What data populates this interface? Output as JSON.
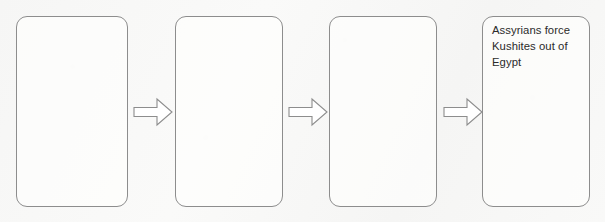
{
  "diagram": {
    "type": "linear-flowchart",
    "orientation": "horizontal",
    "step_count": 4,
    "arrow_count": 3,
    "colors": {
      "background": "#f8f8f7",
      "box_border": "#8d8d8d",
      "box_fill": "#fdfdfc",
      "arrow_stroke": "#8d8d8d",
      "arrow_fill": "#ffffff",
      "text": "#2b2b2b"
    },
    "boxes": [
      {
        "id": "step-1",
        "text": "",
        "x": 16,
        "width": 112
      },
      {
        "id": "step-2",
        "text": "",
        "x": 175,
        "width": 108
      },
      {
        "id": "step-3",
        "text": "",
        "x": 329,
        "width": 108
      },
      {
        "id": "step-4",
        "text": "Assyrians force Kushites out of Egypt",
        "x": 482,
        "width": 108
      }
    ],
    "arrows": [
      {
        "id": "arrow-1",
        "icon": "right-arrow-icon",
        "x": 133,
        "width": 40
      },
      {
        "id": "arrow-2",
        "icon": "right-arrow-icon",
        "x": 288,
        "width": 40
      },
      {
        "id": "arrow-3",
        "icon": "right-arrow-icon",
        "x": 443,
        "width": 40
      }
    ]
  }
}
